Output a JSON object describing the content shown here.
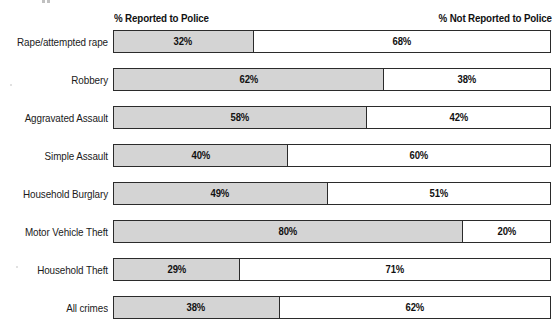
{
  "headers": {
    "left_label": "% Reported to Police",
    "right_label": "% Not Reported to Police"
  },
  "chart_data": {
    "type": "bar",
    "title": "",
    "subtitle": "",
    "xlabel": "",
    "ylabel": "",
    "xlim": [
      0,
      100
    ],
    "grid": false,
    "legend_position": "top",
    "orientation": "horizontal",
    "stacked": true,
    "unit": "%",
    "colors": {
      "reported": "#d4d4d4",
      "not_reported": "#ffffff",
      "outline": "#2b2b2b",
      "text": "#111111"
    },
    "categories": [
      "Rape/attempted rape",
      "Robbery",
      "Aggravated Assault",
      "Simple Assault",
      "Household Burglary",
      "Motor Vehicle Theft",
      "Household Theft",
      "All crimes"
    ],
    "series": [
      {
        "name": "% Reported to Police",
        "values": [
          32,
          62,
          58,
          40,
          49,
          80,
          29,
          38
        ]
      },
      {
        "name": "% Not Reported to Police",
        "values": [
          68,
          38,
          42,
          60,
          51,
          20,
          71,
          62
        ]
      }
    ]
  },
  "rows": [
    {
      "label": "Rape/attempted rape",
      "reported": 32,
      "not_reported": 68,
      "reported_text": "32%",
      "not_reported_text": "68%"
    },
    {
      "label": "Robbery",
      "reported": 62,
      "not_reported": 38,
      "reported_text": "62%",
      "not_reported_text": "38%"
    },
    {
      "label": "Aggravated Assault",
      "reported": 58,
      "not_reported": 42,
      "reported_text": "58%",
      "not_reported_text": "42%"
    },
    {
      "label": "Simple Assault",
      "reported": 40,
      "not_reported": 60,
      "reported_text": "40%",
      "not_reported_text": "60%"
    },
    {
      "label": "Household Burglary",
      "reported": 49,
      "not_reported": 51,
      "reported_text": "49%",
      "not_reported_text": "51%"
    },
    {
      "label": "Motor Vehicle Theft",
      "reported": 80,
      "not_reported": 20,
      "reported_text": "80%",
      "not_reported_text": "20%"
    },
    {
      "label": "Household Theft",
      "reported": 29,
      "not_reported": 71,
      "reported_text": "29%",
      "not_reported_text": "71%"
    },
    {
      "label": "All crimes",
      "reported": 38,
      "not_reported": 62,
      "reported_text": "38%",
      "not_reported_text": "62%"
    }
  ]
}
